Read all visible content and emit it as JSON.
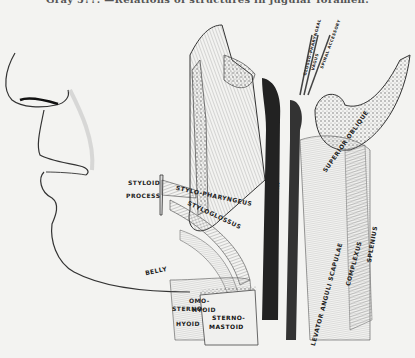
{
  "figure": {
    "title": "Gray 5??. —Relations of structures in jugular foramen.",
    "caption_note": "Title partially cut off at top edge",
    "labels": {
      "styloid_process_1": "STYLOID",
      "styloid_process_2": "PROCESS",
      "stylo_pharyngeus": "STYLO-PHARYNGEUS",
      "stylo_hyoid": "STYLO-HYOID",
      "styloglossus": "STYLOGLOSSUS",
      "belly": "BELLY",
      "omo_hyoid_1": "OMO-",
      "omo_hyoid_2": "HYOID",
      "sterno_hyoid_1": "STERNO-",
      "sterno_hyoid_2": "HYOID",
      "sterno_mastoid_1": "STERNO-",
      "sterno_mastoid_2": "MASTOID",
      "internal_jugular": "INTERNAL JUGULAR",
      "levator_anguli_scapulae": "LEVATOR ANGULI SCAPULAE",
      "complexus": "COMPLEXUS",
      "splenius": "SPLENIUS",
      "superior_oblique": "SUPERIOR OBLIQUE",
      "rectus_capitis": "RECTUS LATERALIS",
      "glosso_pharyngeal": "GLOSSO-PHARYNGEAL",
      "vagus": "VAGUS",
      "spinal_accessory": "SPINAL ACCESSORY",
      "hypoglossal": "HYPOGLOSSAL",
      "descendens": "DESCENDENS"
    }
  }
}
